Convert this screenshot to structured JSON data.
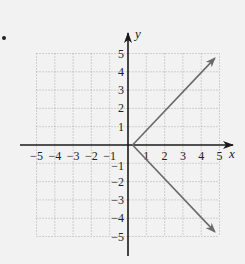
{
  "bullet": "•",
  "chart_data": {
    "type": "line",
    "title": "",
    "xlabel": "x",
    "ylabel": "y",
    "xlim": [
      -5,
      5
    ],
    "ylim": [
      -5,
      5
    ],
    "grid": true,
    "x_ticks": [
      -5,
      -4,
      -3,
      -2,
      -1,
      1,
      2,
      3,
      4,
      5
    ],
    "y_ticks": [
      5,
      4,
      3,
      2,
      1,
      -1,
      -2,
      -3,
      -4,
      -5
    ],
    "x_tick_labels": [
      "−5",
      "−4",
      "−3",
      "−2",
      "−1",
      "1",
      "2",
      "3",
      "4",
      "5"
    ],
    "y_tick_labels": [
      "5",
      "4",
      "3",
      "2",
      "1",
      "−1",
      "−2",
      "−3",
      "−4",
      "−5"
    ],
    "series": [
      {
        "name": "upper-ray",
        "points": [
          [
            0.25,
            0
          ],
          [
            4.75,
            4.75
          ]
        ],
        "arrow_end": true
      },
      {
        "name": "lower-ray",
        "points": [
          [
            0.25,
            0
          ],
          [
            4.75,
            -4.75
          ]
        ],
        "arrow_end": true
      }
    ],
    "colors": {
      "axis": "#1a1a1a",
      "grid": "#9a9a9a",
      "rays": "#6a6a6a",
      "text": "#222222",
      "background": "#f2f2f2"
    }
  }
}
